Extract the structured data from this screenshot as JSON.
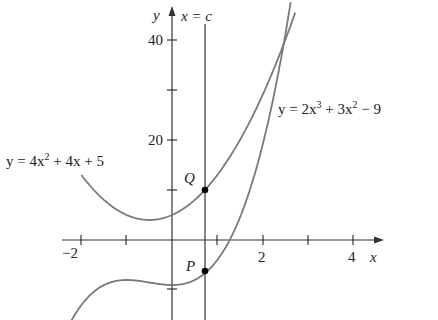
{
  "chart_data": {
    "type": "line",
    "title": "",
    "xlabel": "x",
    "ylabel": "y",
    "xlim": [
      -2.4,
      4.6
    ],
    "ylim": [
      -16,
      48
    ],
    "x_ticks": [
      -2,
      -1,
      0,
      1,
      2,
      3,
      4
    ],
    "x_tick_labels": [
      "-2",
      "2",
      "4"
    ],
    "y_ticks": [
      -10,
      10,
      20,
      30,
      40
    ],
    "y_tick_labels": [
      "20",
      "40"
    ],
    "grid": false,
    "series": [
      {
        "name": "y = 4x^2 + 4x + 5",
        "label": "y = 4x² + 4x + 5",
        "formula": "4x^2+4x+5",
        "x": [
          -2,
          -1.5,
          -1,
          -0.5,
          0,
          0.5,
          0.73,
          1,
          1.5,
          2,
          2.45,
          2.6
        ],
        "values": [
          13,
          8,
          5,
          4,
          5,
          8,
          10.05,
          13,
          20,
          29,
          38.8,
          42.4
        ]
      },
      {
        "name": "y = 2x^3 + 3x^2 - 9",
        "label": "y = 2x³ + 3x² − 9",
        "formula": "2x^3+3x^2-9",
        "x": [
          -2.2,
          -2,
          -1.5,
          -1,
          -0.5,
          0,
          0.5,
          0.73,
          1,
          1.5,
          2,
          2.45,
          2.65
        ],
        "values": [
          -15.8,
          -13,
          -9,
          -8,
          -8.5,
          -9,
          -8,
          -6.6,
          -4,
          4.5,
          19,
          38.4,
          49.3
        ]
      }
    ],
    "annotations": [
      {
        "text": "x = c",
        "type": "vertical-line",
        "x": 0.73
      },
      {
        "text": "Q",
        "type": "point",
        "x": 0.73,
        "y": 10.05,
        "on": "y = 4x^2 + 4x + 5"
      },
      {
        "text": "P",
        "type": "point",
        "x": 0.73,
        "y": -6.6,
        "on": "y = 2x^3 + 3x^2 - 9"
      }
    ]
  },
  "labels": {
    "x_axis": "x",
    "y_axis": "y",
    "vertical_line": "x = c",
    "point_q": "Q",
    "point_p": "P",
    "parabola_lhs": "y = 4x",
    "parabola_exp": "2",
    "parabola_rhs": " + 4x + 5",
    "cubic_a": "y = 2x",
    "cubic_exp1": "3",
    "cubic_b": " + 3x",
    "cubic_exp2": "2",
    "cubic_c": " − 9",
    "tick_neg2": "−2",
    "tick_2": "2",
    "tick_4": "4",
    "tick_20": "20",
    "tick_40": "40"
  }
}
